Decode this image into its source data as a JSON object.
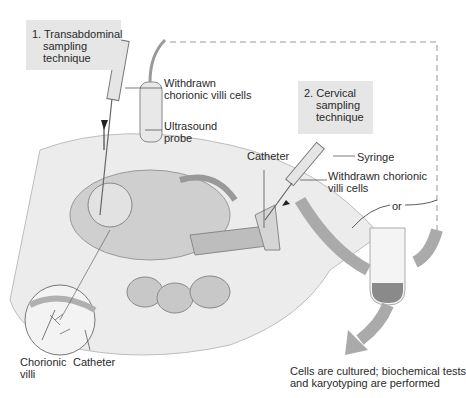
{
  "figure": {
    "technique_1": {
      "number": "1.",
      "line1": "Transabdominal",
      "line2": "sampling",
      "line3": "technique"
    },
    "technique_2": {
      "number": "2.",
      "line1": "Cervical",
      "line2": "sampling",
      "line3": "technique"
    },
    "labels": {
      "withdrawn_cells_1_line1": "Withdrawn",
      "withdrawn_cells_1_line2": "chorionic villi cells",
      "ultrasound_line1": "Ultrasound",
      "ultrasound_line2": "probe",
      "catheter_top": "Catheter",
      "syringe": "Syringe",
      "withdrawn_cells_2_line1": "Withdrawn chorionic",
      "withdrawn_cells_2_line2": "villi cells",
      "or": "or",
      "chorionic_villi_line1": "Chorionic",
      "chorionic_villi_line2": "villi",
      "catheter_bottom": "Catheter",
      "result_line1": "Cells are cultured; biochemical tests",
      "result_line2": "and karyotyping are performed"
    }
  }
}
